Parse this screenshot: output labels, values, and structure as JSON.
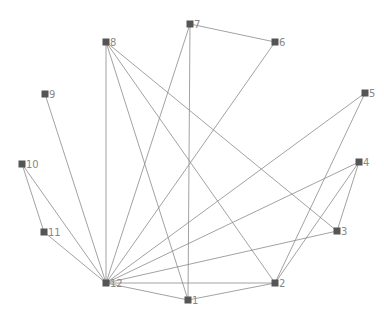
{
  "graph": {
    "title": "",
    "node_color": "#555555",
    "edge_color": "#8a8a8a",
    "label_color": "#888888",
    "nodes": [
      {
        "id": "1",
        "label": "1",
        "x": 188,
        "y": 300
      },
      {
        "id": "2",
        "label": "2",
        "x": 275,
        "y": 283
      },
      {
        "id": "3",
        "label": "3",
        "x": 337,
        "y": 231
      },
      {
        "id": "4",
        "label": "4",
        "x": 359,
        "y": 162
      },
      {
        "id": "5",
        "label": "5",
        "x": 365,
        "y": 93
      },
      {
        "id": "6",
        "label": "6",
        "x": 275,
        "y": 42
      },
      {
        "id": "7",
        "label": "7",
        "x": 190,
        "y": 24
      },
      {
        "id": "8",
        "label": "8",
        "x": 106,
        "y": 42
      },
      {
        "id": "9",
        "label": "9",
        "x": 45,
        "y": 94
      },
      {
        "id": "10",
        "label": "10",
        "x": 22,
        "y": 164
      },
      {
        "id": "11",
        "label": "11",
        "x": 44,
        "y": 232
      },
      {
        "id": "12",
        "label": "12",
        "x": 106,
        "y": 283
      }
    ],
    "edges": [
      {
        "source": "7",
        "target": "6"
      },
      {
        "source": "7",
        "target": "1"
      },
      {
        "source": "12",
        "target": "7"
      },
      {
        "source": "12",
        "target": "6"
      },
      {
        "source": "8",
        "target": "12"
      },
      {
        "source": "8",
        "target": "1"
      },
      {
        "source": "8",
        "target": "2"
      },
      {
        "source": "8",
        "target": "3"
      },
      {
        "source": "12",
        "target": "9"
      },
      {
        "source": "10",
        "target": "11"
      },
      {
        "source": "10",
        "target": "12"
      },
      {
        "source": "11",
        "target": "12"
      },
      {
        "source": "12",
        "target": "5"
      },
      {
        "source": "2",
        "target": "5"
      },
      {
        "source": "12",
        "target": "4"
      },
      {
        "source": "2",
        "target": "4"
      },
      {
        "source": "3",
        "target": "4"
      },
      {
        "source": "12",
        "target": "3"
      },
      {
        "source": "12",
        "target": "2"
      },
      {
        "source": "12",
        "target": "1"
      },
      {
        "source": "1",
        "target": "2"
      }
    ]
  }
}
